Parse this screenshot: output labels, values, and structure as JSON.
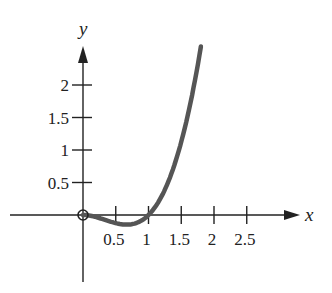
{
  "chart_data": {
    "type": "line",
    "title": "",
    "xlabel": "x",
    "ylabel": "y",
    "xlim": [
      0,
      3
    ],
    "ylim": [
      0,
      2.5
    ],
    "grid": false,
    "x_ticks": [
      "0.5",
      "1",
      "1.5",
      "2",
      "2.5"
    ],
    "y_ticks": [
      "0.5",
      "1",
      "1.5",
      "2"
    ],
    "series": [
      {
        "name": "curve",
        "color": "#555555",
        "x": [
          0,
          0.2,
          0.4,
          0.6,
          0.67,
          0.8,
          1.0,
          1.2,
          1.4,
          1.6,
          1.8
        ],
        "y": [
          0,
          -0.03,
          -0.1,
          -0.14,
          -0.15,
          -0.13,
          0,
          0.29,
          0.78,
          1.54,
          2.6
        ]
      }
    ],
    "annotations": [
      {
        "type": "open-circle",
        "x": 0,
        "y": 0
      }
    ]
  },
  "colors": {
    "axis": "#222222",
    "curve": "#555555"
  }
}
